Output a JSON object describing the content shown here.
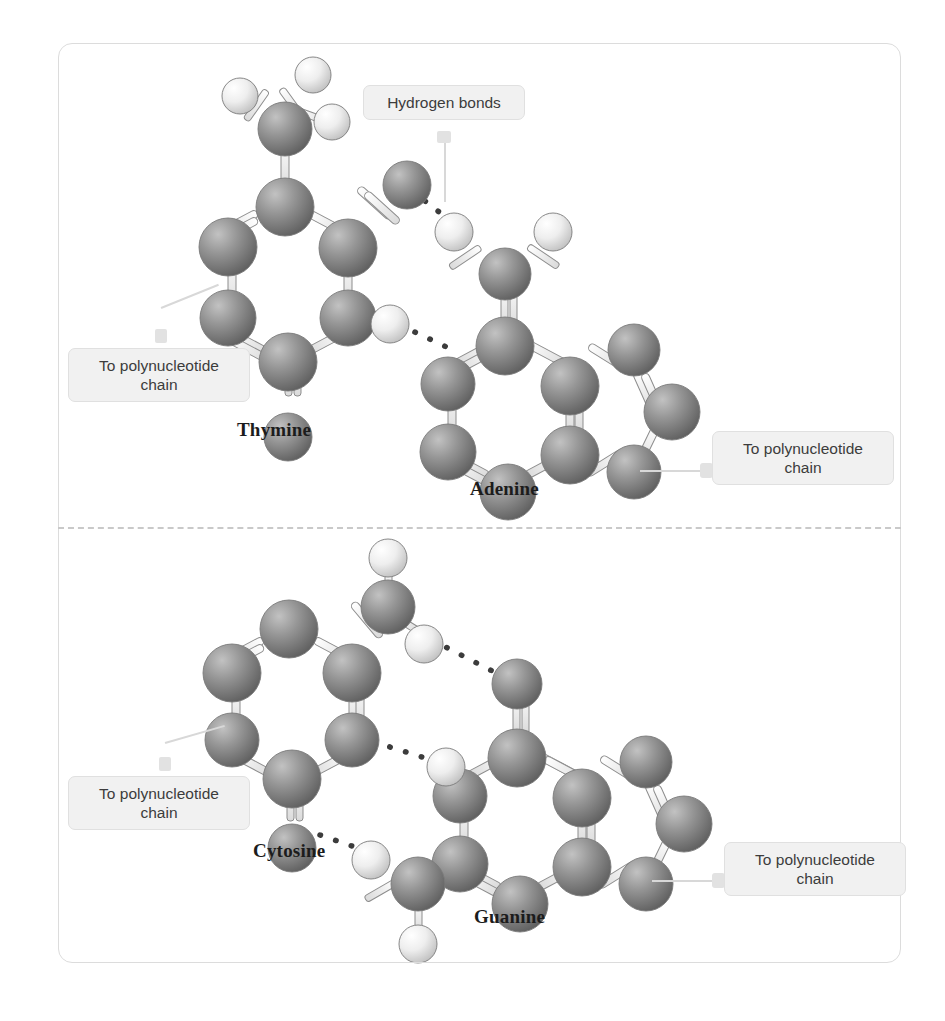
{
  "figure": {
    "frame_color": "#dcdcdc",
    "divider_style": "dashed",
    "background": "#ffffff"
  },
  "callouts": [
    {
      "id": "hydrogen-bonds",
      "text": "Hydrogen bonds",
      "pointer": "down"
    },
    {
      "id": "thymine-chain",
      "text": "To polynucleotide\nchain",
      "pointer": "up"
    },
    {
      "id": "adenine-chain",
      "text": "To polynucleotide\nchain",
      "pointer": "left"
    },
    {
      "id": "cytosine-chain",
      "text": "To polynucleotide\nchain",
      "pointer": "up"
    },
    {
      "id": "guanine-chain",
      "text": "To polynucleotide\nchain",
      "pointer": "left"
    }
  ],
  "panels": [
    {
      "id": "panel-at",
      "pair": "A-T",
      "hydrogen_bond_count": 2,
      "molecules": [
        {
          "id": "thymine",
          "label": "Thymine",
          "ring": "pyrimidine"
        },
        {
          "id": "adenine",
          "label": "Adenine",
          "ring": "purine"
        }
      ]
    },
    {
      "id": "panel-cg",
      "pair": "C-G",
      "hydrogen_bond_count": 3,
      "molecules": [
        {
          "id": "cytosine",
          "label": "Cytosine",
          "ring": "pyrimidine"
        },
        {
          "id": "guanine",
          "label": "Guanine",
          "ring": "purine"
        }
      ]
    }
  ],
  "legend": {
    "dark_atom_color": "#8c8c8c",
    "light_atom_color": "#e4e4e4",
    "bond_color": "#f4f4f4",
    "bond_outline": "#707070",
    "hbond_dot_color": "#3a3a3a"
  },
  "icons": {
    "hydrogen_bond": "dotted-line-icon",
    "atom_dark": "dark-sphere-icon",
    "atom_light": "light-sphere-icon"
  }
}
